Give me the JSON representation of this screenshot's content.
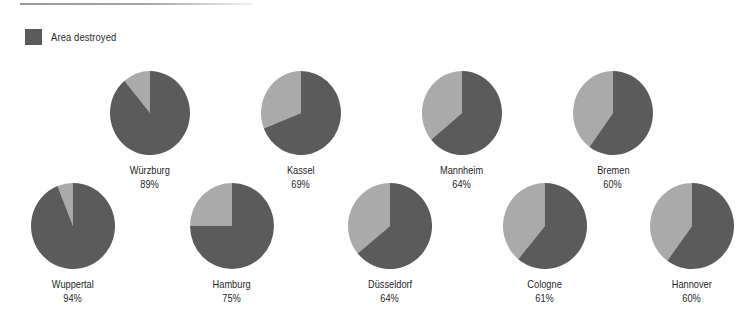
{
  "legend": {
    "label": "Area destroyed",
    "swatch_color": "#5b5b5b"
  },
  "colors": {
    "destroyed": "#5b5b5b",
    "remaining": "#aaaaaa",
    "text": "#1f1f1f",
    "background": "#ffffff",
    "rule": "#9a9a9a"
  },
  "chart_data": {
    "type": "pie",
    "title": "",
    "subtitle": "",
    "xlabel": "",
    "ylabel": "",
    "legend_position": "top-left",
    "grid": false,
    "unit": "%",
    "series_names": [
      "Area destroyed",
      "Area remaining"
    ],
    "categories": [
      "Würzburg",
      "Kassel",
      "Mannheim",
      "Bremen",
      "Wuppertal",
      "Hamburg",
      "Düsseldorf",
      "Cologne",
      "Hannover"
    ],
    "values": [
      89,
      69,
      64,
      60,
      94,
      75,
      64,
      61,
      60
    ],
    "charts": [
      {
        "name": "Würzburg",
        "pct_label": "89%",
        "destroyed": 89,
        "remaining": 11,
        "row": 0,
        "cx": 150,
        "cy": 113,
        "rx": 40,
        "ry": 42
      },
      {
        "name": "Kassel",
        "pct_label": "69%",
        "destroyed": 69,
        "remaining": 31,
        "row": 0,
        "cx": 301,
        "cy": 113,
        "rx": 40,
        "ry": 42
      },
      {
        "name": "Mannheim",
        "pct_label": "64%",
        "destroyed": 64,
        "remaining": 36,
        "row": 0,
        "cx": 462,
        "cy": 113,
        "rx": 40,
        "ry": 42
      },
      {
        "name": "Bremen",
        "pct_label": "60%",
        "destroyed": 60,
        "remaining": 40,
        "row": 0,
        "cx": 613,
        "cy": 113,
        "rx": 40,
        "ry": 42
      },
      {
        "name": "Wuppertal",
        "pct_label": "94%",
        "destroyed": 94,
        "remaining": 6,
        "row": 1,
        "cx": 73,
        "cy": 226,
        "rx": 42,
        "ry": 43
      },
      {
        "name": "Hamburg",
        "pct_label": "75%",
        "destroyed": 75,
        "remaining": 25,
        "row": 1,
        "cx": 232,
        "cy": 226,
        "rx": 42,
        "ry": 43
      },
      {
        "name": "Düsseldorf",
        "pct_label": "64%",
        "destroyed": 64,
        "remaining": 36,
        "row": 1,
        "cx": 390,
        "cy": 226,
        "rx": 42,
        "ry": 43
      },
      {
        "name": "Cologne",
        "pct_label": "61%",
        "destroyed": 61,
        "remaining": 39,
        "row": 1,
        "cx": 545,
        "cy": 226,
        "rx": 42,
        "ry": 43
      },
      {
        "name": "Hannover",
        "pct_label": "60%",
        "destroyed": 60,
        "remaining": 40,
        "row": 1,
        "cx": 692,
        "cy": 226,
        "rx": 42,
        "ry": 43
      }
    ]
  }
}
